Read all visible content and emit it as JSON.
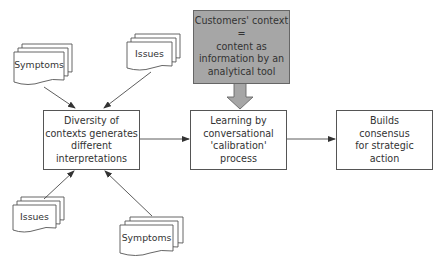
{
  "diagram": {
    "nodes": {
      "context_box": {
        "label": "Customers' context\n=\ncontent as\ninformation by an\nanalytical tool",
        "fill": "#a6a6a6"
      },
      "diversity_box": {
        "label": "Diversity of\ncontexts generates\ndifferent\ninterpretations"
      },
      "learning_box": {
        "label": "Learning by\nconversational\n'calibration'\nprocess"
      },
      "builds_box": {
        "label": "Builds\nconsensus\nfor strategic\naction"
      }
    },
    "documents": [
      {
        "label": "Symptoms",
        "position": "top-left"
      },
      {
        "label": "Issues",
        "position": "top"
      },
      {
        "label": "Issues",
        "position": "bottom-left"
      },
      {
        "label": "Symptoms",
        "position": "bottom"
      }
    ],
    "edges": [
      {
        "from": "Symptoms (top-left)",
        "to": "Diversity of contexts generates different interpretations"
      },
      {
        "from": "Issues (top)",
        "to": "Diversity of contexts generates different interpretations"
      },
      {
        "from": "Issues (bottom-left)",
        "to": "Diversity of contexts generates different interpretations"
      },
      {
        "from": "Symptoms (bottom)",
        "to": "Diversity of contexts generates different interpretations"
      },
      {
        "from": "Diversity of contexts generates different interpretations",
        "to": "Learning by conversational 'calibration' process"
      },
      {
        "from": "Customers' context = content as information by an analytical tool",
        "to": "Learning by conversational 'calibration' process",
        "style": "block-arrow"
      },
      {
        "from": "Learning by conversational 'calibration' process",
        "to": "Builds consensus for strategic action"
      }
    ]
  }
}
